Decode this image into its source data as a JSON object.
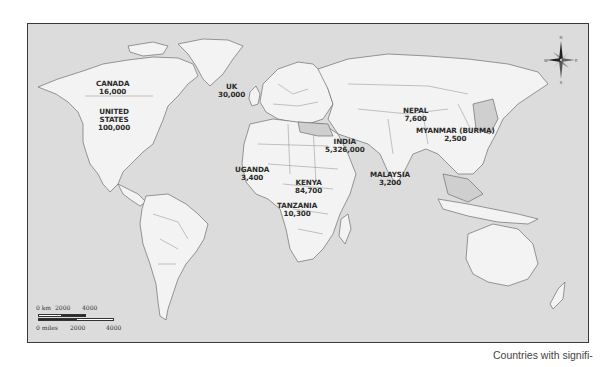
{
  "map": {
    "type": "world political outline map",
    "background_color": "#dcdcdc",
    "land_color": "#f3f3f3",
    "highlight_land_color": "#cfcfcf",
    "labels": [
      {
        "country": "CANADA",
        "value": "16,000"
      },
      {
        "country": "UNITED STATES",
        "lines": [
          "UNITED",
          "STATES"
        ],
        "value": "100,000"
      },
      {
        "country": "UK",
        "value": "30,000"
      },
      {
        "country": "NEPAL",
        "value": "7,600"
      },
      {
        "country": "MYANMAR (BURMA)",
        "value": "2,500"
      },
      {
        "country": "INDIA",
        "value": "5,326,000"
      },
      {
        "country": "UGANDA",
        "value": "3,400"
      },
      {
        "country": "KENYA",
        "value": "84,700"
      },
      {
        "country": "MALAYSIA",
        "value": "3,200"
      },
      {
        "country": "TANZANIA",
        "value": "10,300"
      }
    ],
    "scale_bar": {
      "km_label": "0 km",
      "km_ticks": [
        "2000",
        "4000"
      ],
      "miles_label": "0 miles",
      "miles_ticks": [
        "2000",
        "4000"
      ]
    },
    "compass": {
      "n": "N",
      "s": "S",
      "e": "E",
      "w": "W"
    }
  },
  "caption": "Countries with signifi-"
}
